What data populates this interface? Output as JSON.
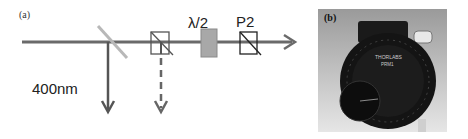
{
  "panel_a": {
    "label": "(a)",
    "wavelength_label": "400nm",
    "half_wave_plate_label": "λ/2",
    "polarizer_label": "P2",
    "colors": {
      "beam": "#6a6a6a",
      "beam_splitter": "#b8b8b8",
      "waveplate_fill": "#a8a8a8",
      "outline": "#333333"
    },
    "elements": [
      {
        "id": "beam-splitter",
        "type": "mirror"
      },
      {
        "id": "polarizing-beam-splitter-cube",
        "type": "cube"
      },
      {
        "id": "half-wave-plate",
        "type": "waveplate",
        "label": "λ/2"
      },
      {
        "id": "polarizer-p2",
        "type": "polarizer",
        "label": "P2"
      }
    ],
    "beams": [
      {
        "id": "main-beam",
        "direction": "right",
        "style": "solid"
      },
      {
        "id": "reflected-400nm",
        "direction": "down",
        "style": "solid",
        "label": "400nm"
      },
      {
        "id": "rejected-beam",
        "direction": "down",
        "style": "dashed"
      }
    ]
  },
  "panel_b": {
    "label": "(b)",
    "photo_subject": "rotating polarizer mount",
    "engraving_top": "THORLABS",
    "engraving_sub": "PRM1"
  }
}
